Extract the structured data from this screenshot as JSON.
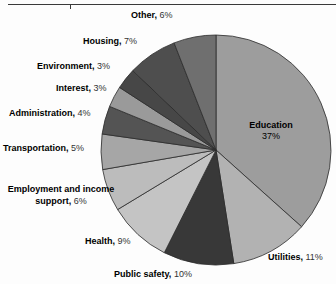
{
  "page": {
    "width": 336,
    "height": 284,
    "background": "#fdfdfd"
  },
  "divider": {
    "name": "top-horizontal-rule",
    "color": "#3a3a3a"
  },
  "chart_data": {
    "type": "pie",
    "title": "",
    "subtitle": "",
    "xlabel": "",
    "ylabel": "",
    "legend_position": "callout-labels",
    "grid": false,
    "start_angle_deg": 0,
    "direction": "clockwise",
    "center": {
      "x": 216,
      "y": 150
    },
    "radius": 115,
    "categories": [
      "Education",
      "Utilities",
      "Public safety",
      "Health",
      "Employment and income support",
      "Transportation",
      "Administration",
      "Interest",
      "Environment",
      "Housing",
      "Other"
    ],
    "values": [
      37,
      11,
      10,
      9,
      6,
      5,
      4,
      3,
      3,
      7,
      6
    ],
    "value_labels": [
      "37%",
      "11%",
      "10%",
      "9%",
      "6%",
      "5%",
      "4%",
      "3%",
      "3%",
      "7%",
      "6%"
    ],
    "units": "percent",
    "total": 101,
    "colors": [
      "#9d9d9d",
      "#b2b2b2",
      "#383838",
      "#c4c4c4",
      "#bcbcbc",
      "#a6a6a6",
      "#545454",
      "#9a9a9a",
      "#474747",
      "#4e4e4e",
      "#6f6f6f"
    ],
    "slice_border_color": "#2b2b2b",
    "slices": [
      {
        "label": "Education",
        "value": 37,
        "display": "37%",
        "color": "#9d9d9d"
      },
      {
        "label": "Utilities",
        "value": 11,
        "display": "11%",
        "color": "#b2b2b2"
      },
      {
        "label": "Public safety",
        "value": 10,
        "display": "10%",
        "color": "#383838"
      },
      {
        "label": "Health",
        "value": 9,
        "display": "9%",
        "color": "#c4c4c4"
      },
      {
        "label": "Employment and income support",
        "value": 6,
        "display": "6%",
        "color": "#bcbcbc"
      },
      {
        "label": "Transportation",
        "value": 5,
        "display": "5%",
        "color": "#a6a6a6"
      },
      {
        "label": "Administration",
        "value": 4,
        "display": "4%",
        "color": "#545454"
      },
      {
        "label": "Interest",
        "value": 3,
        "display": "3%",
        "color": "#9a9a9a"
      },
      {
        "label": "Environment",
        "value": 3,
        "display": "3%",
        "color": "#474747"
      },
      {
        "label": "Housing",
        "value": 7,
        "display": "7%",
        "color": "#4e4e4e"
      },
      {
        "label": "Other",
        "value": 6,
        "display": "6%",
        "color": "#6f6f6f"
      }
    ]
  },
  "labels": {
    "other": {
      "name": "Other,",
      "pct": "6%"
    },
    "housing": {
      "name": "Housing,",
      "pct": "7%"
    },
    "environment": {
      "name": "Environment,",
      "pct": "3%"
    },
    "interest": {
      "name": "Interest,",
      "pct": "3%"
    },
    "administration": {
      "name": "Administration,",
      "pct": "4%"
    },
    "transportation": {
      "name": "Transportation,",
      "pct": "5%"
    },
    "employment": {
      "name": "Employment and income support,",
      "pct": "6%"
    },
    "health": {
      "name": "Health,",
      "pct": "9%"
    },
    "public_safety": {
      "name": "Public safety,",
      "pct": "10%"
    },
    "utilities": {
      "name": "Utilities,",
      "pct": "11%"
    },
    "education": {
      "name": "Education",
      "pct": "37%"
    }
  }
}
